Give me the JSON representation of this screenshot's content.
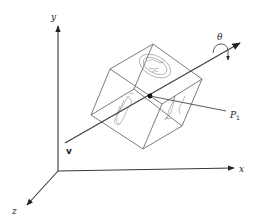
{
  "figure": {
    "type": "3D rotation about an arbitrary axis",
    "axes": {
      "x_label": "x",
      "y_label": "y",
      "z_label": "z"
    },
    "rotation_axis": {
      "vector_label": "v",
      "angle_label": "θ"
    },
    "point": {
      "label_main": "P",
      "label_sub": "1"
    },
    "colors": {
      "lines": "#3a3a3a",
      "cube_edges": "#5a5a5a",
      "point": "#000000",
      "background": "#ffffff"
    }
  }
}
